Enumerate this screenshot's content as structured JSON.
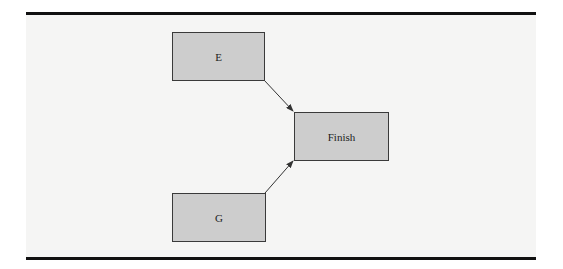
{
  "diagram": {
    "type": "activity-network",
    "nodes": [
      {
        "id": "E",
        "label": "E"
      },
      {
        "id": "G",
        "label": "G"
      },
      {
        "id": "Finish",
        "label": "Finish"
      }
    ],
    "edges": [
      {
        "from": "E",
        "to": "Finish"
      },
      {
        "from": "G",
        "to": "Finish"
      }
    ],
    "colors": {
      "background": "#f5f5f4",
      "node_fill": "#cdcdcd",
      "node_border": "#3a3a3a",
      "edge": "#333333",
      "rule": "#111111"
    }
  }
}
